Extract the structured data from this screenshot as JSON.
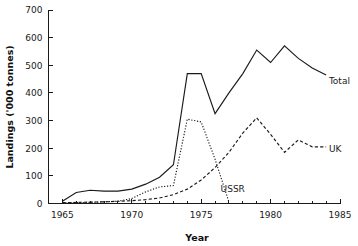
{
  "chart_data": {
    "type": "line",
    "title": "",
    "xlabel": "Year",
    "ylabel": "Landings ('000 tonnes)",
    "xlim": [
      1964,
      1985
    ],
    "ylim": [
      0,
      700
    ],
    "xticks": [
      1965,
      1970,
      1975,
      1980,
      1985
    ],
    "xticklabels": [
      "1965",
      "1970",
      "1975",
      "1980",
      "1985"
    ],
    "xminorticks": [
      1966,
      1967,
      1968,
      1969,
      1971,
      1972,
      1973,
      1974,
      1976,
      1977,
      1978,
      1979,
      1981,
      1982,
      1983,
      1984
    ],
    "yticks": [
      0,
      100,
      200,
      300,
      400,
      500,
      600,
      700
    ],
    "yticklabels": [
      "0",
      "100",
      "200",
      "300",
      "400",
      "500",
      "600",
      "700"
    ],
    "grid": false,
    "legend_position": "inline-right-of-line-ends",
    "x": [
      1965,
      1966,
      1967,
      1968,
      1969,
      1970,
      1971,
      1972,
      1973,
      1974,
      1975,
      1976,
      1977,
      1978,
      1979,
      1980,
      1981,
      1982,
      1983,
      1984
    ],
    "series": [
      {
        "name": "Total",
        "label": "Total",
        "linestyle": "solid",
        "color": "#1a1a1a",
        "values": [
          8,
          40,
          48,
          45,
          45,
          52,
          70,
          95,
          140,
          470,
          470,
          325,
          400,
          470,
          555,
          510,
          570,
          525,
          490,
          465
        ]
      },
      {
        "name": "UK",
        "label": "UK",
        "linestyle": "dashed",
        "color": "#1a1a1a",
        "values": [
          3,
          4,
          5,
          6,
          8,
          10,
          14,
          20,
          32,
          52,
          85,
          130,
          185,
          255,
          310,
          250,
          185,
          230,
          205,
          205
        ]
      },
      {
        "name": "USSR",
        "label": "USSR",
        "linestyle": "dotted",
        "color": "#1a1a1a",
        "values": [
          2,
          3,
          4,
          6,
          8,
          18,
          42,
          60,
          65,
          305,
          295,
          160,
          5,
          null,
          null,
          null,
          null,
          null,
          null,
          null
        ]
      }
    ],
    "annotations": [
      {
        "text": "Total",
        "x": 1984.2,
        "y": 445
      },
      {
        "text": "UK",
        "x": 1984.2,
        "y": 200
      },
      {
        "text": "USSR",
        "x": 1976.4,
        "y": 55
      }
    ]
  }
}
